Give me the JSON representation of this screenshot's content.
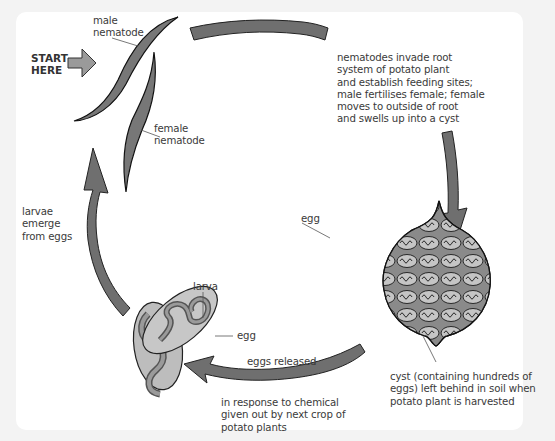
{
  "diagram": {
    "colors": {
      "background": "#f3f3f3",
      "panel": "#ffffff",
      "arrow_fill": "#6f6f6f",
      "worm_fill": "#777777",
      "egg_fill": "#c4c4c4",
      "cyst_fill": "#8a8a8a",
      "text": "#3a3a3a"
    },
    "start_label": "START\nHERE",
    "labels": {
      "male": "male\nnematode",
      "female": "female\nnematode",
      "invade": "nematodes invade root\nsystem of potato plant\nand establish feeding sites;\nmale fertilises female; female\nmoves to outside of root\nand swells up into a cyst",
      "cyst_egg": "egg",
      "cyst": "cyst (containing hundreds of\neggs) left behind in soil when\npotato plant is harvested",
      "eggs_released": "eggs released",
      "response": "in response to chemical\ngiven out by next crop of\npotato plants",
      "larva": "larva",
      "egg": "egg",
      "larvae_emerge": "larvae\nemerge\nfrom eggs"
    },
    "stages": [
      "male and female nematodes",
      "nematodes invade root system",
      "cyst left in soil",
      "eggs released",
      "larvae emerge from eggs"
    ]
  }
}
